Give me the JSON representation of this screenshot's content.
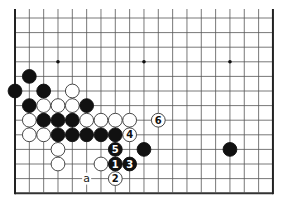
{
  "diagram": {
    "board": {
      "columns": 19,
      "visible_rows": 13,
      "origin_x": 15,
      "origin_y": 18,
      "spacing_x": 14.33,
      "spacing_y": 14.6,
      "edges": {
        "left": true,
        "right": true,
        "bottom": true,
        "top": false
      },
      "line_color": "#555555",
      "edge_color": "#222222",
      "stone_radius": 6.9
    },
    "star_points": [
      {
        "col": 3,
        "row": 3
      },
      {
        "col": 9,
        "row": 3
      },
      {
        "col": 15,
        "row": 3
      },
      {
        "col": 3,
        "row": 9
      },
      {
        "col": 9,
        "row": 9
      },
      {
        "col": 15,
        "row": 9
      }
    ],
    "stones": [
      {
        "color": "black",
        "col": 1,
        "row": 4,
        "label": ""
      },
      {
        "color": "black",
        "col": 0,
        "row": 5,
        "label": ""
      },
      {
        "color": "black",
        "col": 2,
        "row": 5,
        "label": ""
      },
      {
        "color": "white",
        "col": 4,
        "row": 5,
        "label": ""
      },
      {
        "color": "black",
        "col": 1,
        "row": 6,
        "label": ""
      },
      {
        "color": "white",
        "col": 2,
        "row": 6,
        "label": ""
      },
      {
        "color": "white",
        "col": 3,
        "row": 6,
        "label": ""
      },
      {
        "color": "white",
        "col": 4,
        "row": 6,
        "label": ""
      },
      {
        "color": "black",
        "col": 5,
        "row": 6,
        "label": ""
      },
      {
        "color": "white",
        "col": 1,
        "row": 7,
        "label": ""
      },
      {
        "color": "black",
        "col": 2,
        "row": 7,
        "label": ""
      },
      {
        "color": "black",
        "col": 3,
        "row": 7,
        "label": ""
      },
      {
        "color": "black",
        "col": 4,
        "row": 7,
        "label": ""
      },
      {
        "color": "white",
        "col": 5,
        "row": 7,
        "label": ""
      },
      {
        "color": "white",
        "col": 6,
        "row": 7,
        "label": ""
      },
      {
        "color": "white",
        "col": 7,
        "row": 7,
        "label": ""
      },
      {
        "color": "white",
        "col": 8,
        "row": 7,
        "label": ""
      },
      {
        "color": "white",
        "col": 10,
        "row": 7,
        "label": "6"
      },
      {
        "color": "white",
        "col": 1,
        "row": 8,
        "label": ""
      },
      {
        "color": "white",
        "col": 2,
        "row": 8,
        "label": ""
      },
      {
        "color": "black",
        "col": 3,
        "row": 8,
        "label": ""
      },
      {
        "color": "black",
        "col": 4,
        "row": 8,
        "label": ""
      },
      {
        "color": "black",
        "col": 5,
        "row": 8,
        "label": ""
      },
      {
        "color": "black",
        "col": 6,
        "row": 8,
        "label": ""
      },
      {
        "color": "black",
        "col": 7,
        "row": 8,
        "label": ""
      },
      {
        "color": "white",
        "col": 8,
        "row": 8,
        "label": "4"
      },
      {
        "color": "white",
        "col": 3,
        "row": 9,
        "label": ""
      },
      {
        "color": "black",
        "col": 7,
        "row": 9,
        "label": "5"
      },
      {
        "color": "black",
        "col": 9,
        "row": 9,
        "label": ""
      },
      {
        "color": "black",
        "col": 15,
        "row": 9,
        "label": ""
      },
      {
        "color": "white",
        "col": 3,
        "row": 10,
        "label": ""
      },
      {
        "color": "white",
        "col": 6,
        "row": 10,
        "label": ""
      },
      {
        "color": "black",
        "col": 7,
        "row": 10,
        "label": "1"
      },
      {
        "color": "black",
        "col": 8,
        "row": 10,
        "label": "3"
      },
      {
        "color": "white",
        "col": 7,
        "row": 11,
        "label": "2"
      }
    ],
    "markers": [
      {
        "type": "letter",
        "text": "a",
        "col": 5,
        "row": 11
      }
    ],
    "colors": {
      "black_stone": "#111111",
      "white_stone": "#ffffff",
      "white_stone_border": "#333333",
      "background": "#ffffff"
    }
  }
}
